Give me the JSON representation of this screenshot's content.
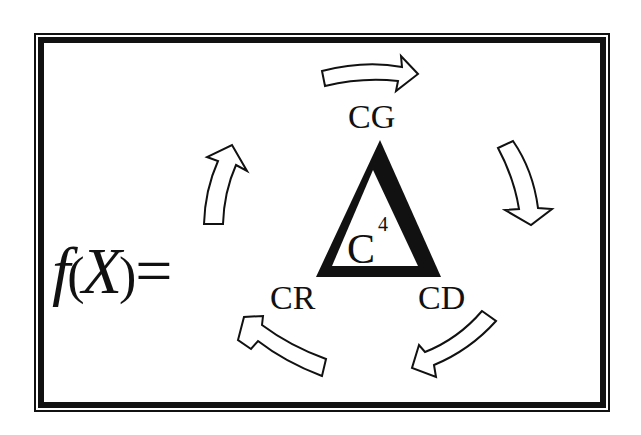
{
  "diagram": {
    "function_label": {
      "name": "f",
      "open_paren": "(",
      "variable": "X",
      "close_paren": ")",
      "equals": "="
    },
    "center": {
      "symbol": "Δ",
      "letter": "C",
      "superscript": "4"
    },
    "nodes": [
      {
        "id": "cg",
        "label": "CG",
        "position": "top"
      },
      {
        "id": "cd",
        "label": "CD",
        "position": "bottom-right"
      },
      {
        "id": "cr",
        "label": "CR",
        "position": "bottom-left"
      }
    ],
    "arrows": [
      {
        "id": "top",
        "direction": "right",
        "cycle": "clockwise"
      },
      {
        "id": "right",
        "direction": "down"
      },
      {
        "id": "bottom-right",
        "direction": "down-left"
      },
      {
        "id": "bottom-left",
        "direction": "up-left"
      },
      {
        "id": "left",
        "direction": "up"
      }
    ],
    "colors": {
      "ink": "#111111",
      "background": "#ffffff"
    }
  }
}
